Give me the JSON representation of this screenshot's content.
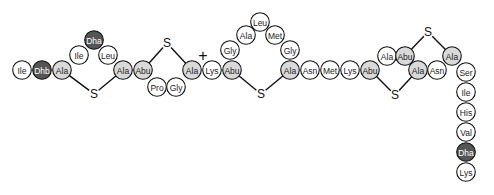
{
  "diagram": {
    "colors": {
      "residue_default": "#ffffff",
      "residue_modified_light": "#d9d9d9",
      "residue_dehydrated_dark": "#555555",
      "outline": "#111111"
    },
    "plus_sign": "+",
    "residues": [
      {
        "label": "Ile",
        "shade": "white",
        "x": 22,
        "y": 70
      },
      {
        "label": "Dhb",
        "shade": "dark",
        "x": 42,
        "y": 70
      },
      {
        "label": "Ala",
        "shade": "light",
        "x": 62,
        "y": 70
      },
      {
        "label": "Ile",
        "shade": "white",
        "x": 79,
        "y": 55
      },
      {
        "label": "Dha",
        "shade": "dark",
        "x": 94,
        "y": 40
      },
      {
        "label": "Leu",
        "shade": "white",
        "x": 108,
        "y": 55
      },
      {
        "label": "Ala",
        "shade": "light",
        "x": 123,
        "y": 70
      },
      {
        "label": "Abu",
        "shade": "light",
        "x": 143,
        "y": 70
      },
      {
        "label": "Pro",
        "shade": "white",
        "x": 157,
        "y": 87
      },
      {
        "label": "Gly",
        "shade": "white",
        "x": 176,
        "y": 87
      },
      {
        "label": "Ala",
        "shade": "light",
        "x": 192,
        "y": 70
      },
      {
        "label": "Lys",
        "shade": "white",
        "x": 212,
        "y": 70
      },
      {
        "label": "Abu",
        "shade": "light",
        "x": 232,
        "y": 70
      },
      {
        "label": "Gly",
        "shade": "white",
        "x": 230,
        "y": 50
      },
      {
        "label": "Ala",
        "shade": "white",
        "x": 246,
        "y": 35
      },
      {
        "label": "Leu",
        "shade": "white",
        "x": 260,
        "y": 22
      },
      {
        "label": "Met",
        "shade": "white",
        "x": 275,
        "y": 35
      },
      {
        "label": "Gly",
        "shade": "white",
        "x": 290,
        "y": 50
      },
      {
        "label": "Ala",
        "shade": "light",
        "x": 290,
        "y": 70
      },
      {
        "label": "Asn",
        "shade": "white",
        "x": 310,
        "y": 70
      },
      {
        "label": "Met",
        "shade": "white",
        "x": 330,
        "y": 70
      },
      {
        "label": "Lys",
        "shade": "white",
        "x": 350,
        "y": 70
      },
      {
        "label": "Abu",
        "shade": "light",
        "x": 370,
        "y": 70
      },
      {
        "label": "Ala",
        "shade": "white",
        "x": 387,
        "y": 56
      },
      {
        "label": "Abu",
        "shade": "light",
        "x": 405,
        "y": 56
      },
      {
        "label": "Ala",
        "shade": "light",
        "x": 418,
        "y": 70
      },
      {
        "label": "Asn",
        "shade": "white",
        "x": 437,
        "y": 70
      },
      {
        "label": "Ala",
        "shade": "light",
        "x": 452,
        "y": 56
      },
      {
        "label": "Ser",
        "shade": "white",
        "x": 466,
        "y": 72
      },
      {
        "label": "Ile",
        "shade": "white",
        "x": 466,
        "y": 92
      },
      {
        "label": "His",
        "shade": "white",
        "x": 466,
        "y": 112
      },
      {
        "label": "Val",
        "shade": "white",
        "x": 466,
        "y": 132
      },
      {
        "label": "Dha",
        "shade": "dark",
        "x": 466,
        "y": 152
      },
      {
        "label": "Lys",
        "shade": "white",
        "x": 466,
        "y": 172
      }
    ],
    "bridges": [
      {
        "label": "S",
        "x": 94,
        "y": 94,
        "from": 2,
        "to": 6
      },
      {
        "label": "S",
        "x": 167,
        "y": 43,
        "from": 7,
        "to": 10
      },
      {
        "label": "S",
        "x": 261,
        "y": 94,
        "from": 12,
        "to": 18
      },
      {
        "label": "S",
        "x": 395,
        "y": 95,
        "from": 22,
        "to": 25
      },
      {
        "label": "S",
        "x": 428,
        "y": 32,
        "from": 24,
        "to": 27
      }
    ],
    "plus_position": {
      "x": 203,
      "y": 55
    }
  }
}
